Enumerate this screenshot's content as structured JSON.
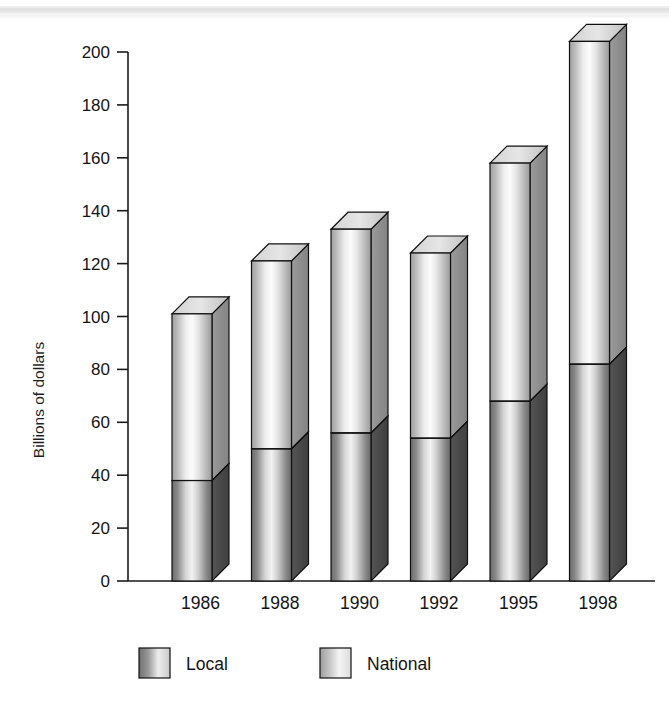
{
  "chart_data": {
    "type": "bar",
    "subtype": "stacked-3d-column",
    "title": "",
    "subtitle": "",
    "xlabel": "",
    "ylabel": "Billions of dollars",
    "categories": [
      "1986",
      "1988",
      "1990",
      "1992",
      "1995",
      "1998"
    ],
    "series": [
      {
        "name": "Local",
        "values": [
          38,
          50,
          56,
          54,
          68,
          82
        ]
      },
      {
        "name": "National",
        "values": [
          63,
          71,
          77,
          70,
          90,
          122
        ]
      }
    ],
    "totals": [
      101,
      121,
      133,
      124,
      158,
      204
    ],
    "ylim": [
      0,
      200
    ],
    "ytick_step": 20,
    "yticks": [
      0,
      20,
      40,
      60,
      80,
      100,
      120,
      140,
      160,
      180,
      200
    ],
    "ytick_labels": [
      "0",
      "20",
      "40",
      "60",
      "80",
      "100",
      "120",
      "140",
      "160",
      "180",
      "200"
    ],
    "grid": false,
    "legend_position": "bottom",
    "legend": [
      {
        "name": "Local",
        "swatch": "dark-gradient-swatch"
      },
      {
        "name": "National",
        "swatch": "light-gradient-swatch"
      }
    ],
    "annotations": []
  },
  "axis": {
    "y_title": "Billions of dollars"
  },
  "colors": {
    "local_front_mid": "#f0f0f0",
    "local_front_edge": "#6e6e6e",
    "local_side": "#4a4a4a",
    "local_side_edge": "#3a3a3a",
    "national_front_mid": "#fbfbfb",
    "national_front_edge": "#a9a9a9",
    "national_side": "#8f8f8f",
    "national_top": "#dcdcdc",
    "outline": "#111111",
    "axis": "#1a1a1a",
    "background": "#ffffff"
  }
}
